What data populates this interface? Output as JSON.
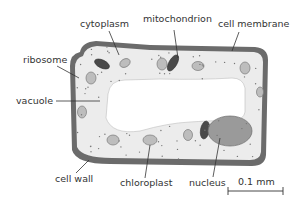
{
  "labels": {
    "cytoplasm": "cytoplasm",
    "mitochondrion": "mitochondrion",
    "cell_membrane": "cell membrane",
    "ribosome": "ribosome",
    "vacuole": "vacuole",
    "cell_wall": "cell wall",
    "chloroplast": "chloroplast",
    "nucleus": "nucleus",
    "scale": "0.1 mm"
  },
  "colors": {
    "cell_wall": "#6b6b6b",
    "cytoplasm": "#ececec",
    "vacuole": "#ffffff",
    "organelle": "#bdbdbd",
    "mitochondrion": "#4a4a4a",
    "nucleus": "#9a9a9a",
    "text": "#333333",
    "leader": "#333333"
  }
}
